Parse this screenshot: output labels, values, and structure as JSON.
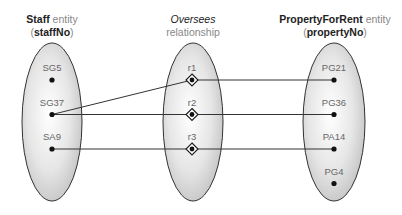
{
  "entities": {
    "left": {
      "name": "Staff",
      "kind": "entity",
      "key": "staffNo",
      "members": [
        "SG5",
        "SG37",
        "SA9"
      ]
    },
    "relationship": {
      "name": "Oversees",
      "kind": "relationship",
      "members": [
        "r1",
        "r2",
        "r3"
      ]
    },
    "right": {
      "name": "PropertyForRent",
      "kind": "entity",
      "key": "propertyNo",
      "members": [
        "PG21",
        "PG36",
        "PA14",
        "PG4"
      ]
    }
  },
  "links": [
    {
      "from": "SG37",
      "to": "r1"
    },
    {
      "from": "SG37",
      "to": "r2"
    },
    {
      "from": "SA9",
      "to": "r3"
    },
    {
      "from": "r1",
      "to": "PG21"
    },
    {
      "from": "r2",
      "to": "PG36"
    },
    {
      "from": "r3",
      "to": "PA14"
    }
  ],
  "icons": {
    "occurrence": "filled-dot",
    "relationship_occurrence": "diamond-with-dot"
  },
  "colors": {
    "outline": "#333333",
    "fill_light": "#ffffff",
    "fill_dark": "#c4c4c4",
    "label": "#666666"
  }
}
